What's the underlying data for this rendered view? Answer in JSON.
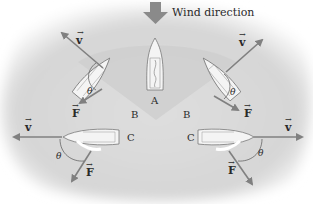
{
  "title": "Wind direction",
  "colors": {
    "background_blob": "#dcdcdc",
    "cone": "#c9c9c9",
    "arrow": "#808080",
    "wind_arrow": "#8a8a8a",
    "hull": "#f4f4f4",
    "hull_outline": "#777777"
  },
  "labels": {
    "wind": "Wind direction",
    "boat_a": "A",
    "boat_b_left": "B",
    "boat_b_right": "B",
    "boat_c_left": "C",
    "boat_c_right": "C",
    "velocity": "v",
    "force": "F",
    "angle": "θ"
  },
  "boats": [
    {
      "id": "A",
      "label": "A",
      "heading": "into wind (upwind)"
    },
    {
      "id": "B-left",
      "label": "B",
      "heading": "upper-left",
      "vectors": [
        "v",
        "F"
      ],
      "angle": "θ"
    },
    {
      "id": "B-right",
      "label": "B",
      "heading": "upper-right",
      "vectors": [
        "v",
        "F"
      ],
      "angle": "θ"
    },
    {
      "id": "C-left",
      "label": "C",
      "heading": "left",
      "vectors": [
        "v",
        "F"
      ],
      "angle": "θ"
    },
    {
      "id": "C-right",
      "label": "C",
      "heading": "right",
      "vectors": [
        "v",
        "F"
      ],
      "angle": "θ"
    }
  ]
}
